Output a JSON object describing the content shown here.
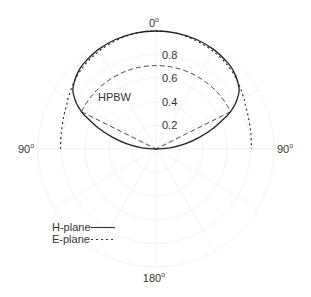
{
  "chart_data": {
    "type": "polar-line",
    "title": "",
    "center_px": [
      156,
      149
    ],
    "radius_px": 118,
    "r_range": [
      0,
      1
    ],
    "r_ticks": [
      0.2,
      0.4,
      0.6,
      0.8
    ],
    "r_tick_labels": [
      "0.2",
      "0.4",
      "0.6",
      "0.8"
    ],
    "angle_labels": [
      {
        "angle_deg": 0,
        "text": "0",
        "sup": "o"
      },
      {
        "angle_deg": -90,
        "text": "90",
        "sup": "o"
      },
      {
        "angle_deg": 90,
        "text": "90",
        "sup": "o"
      },
      {
        "angle_deg": 180,
        "text": "180",
        "sup": "o"
      }
    ],
    "grid": {
      "circles": [
        0.2,
        0.4,
        0.6,
        0.8,
        1.0
      ],
      "spokes_every_deg": 30,
      "color": "#eeeeee"
    },
    "series": [
      {
        "name": "H-plane",
        "style": "solid",
        "color": "#222222",
        "theta_deg": [
          -90,
          -85,
          -80,
          -75,
          -70,
          -65,
          -63.4,
          -60,
          -55,
          -50,
          -45,
          -40,
          -30,
          -20,
          -10,
          0,
          10,
          20,
          30,
          40,
          45,
          50,
          55,
          60,
          63.4,
          65,
          70,
          75,
          80,
          85,
          90
        ],
        "r": [
          0,
          0.12,
          0.25,
          0.38,
          0.52,
          0.66,
          0.707,
          0.78,
          0.86,
          0.9,
          0.93,
          0.95,
          0.975,
          0.99,
          0.998,
          1.0,
          0.998,
          0.99,
          0.975,
          0.95,
          0.93,
          0.9,
          0.86,
          0.78,
          0.707,
          0.66,
          0.52,
          0.38,
          0.25,
          0.12,
          0
        ]
      },
      {
        "name": "E-plane",
        "style": "dotted",
        "color": "#222222",
        "theta_deg": [
          -90,
          -80,
          -70,
          -63.4,
          -60,
          -50,
          -40,
          -30,
          -20,
          -10,
          0,
          10,
          20,
          30,
          40,
          50,
          60,
          63.4,
          70,
          80,
          90
        ],
        "r": [
          0.81,
          0.815,
          0.83,
          0.845,
          0.86,
          0.9,
          0.935,
          0.96,
          0.98,
          0.995,
          1.0,
          0.995,
          0.98,
          0.96,
          0.935,
          0.9,
          0.86,
          0.845,
          0.83,
          0.815,
          0.81
        ]
      }
    ],
    "annotations": [
      {
        "text": "HPBW",
        "type": "half-power beamwidth",
        "r_level": 0.707,
        "theta_range_deg": [
          -63.4,
          63.4
        ],
        "style": "dashed"
      }
    ],
    "legend": {
      "position": "lower-left",
      "entries": [
        {
          "label": "H-plane",
          "style": "solid"
        },
        {
          "label": "E-plane",
          "style": "dotted"
        }
      ]
    }
  }
}
